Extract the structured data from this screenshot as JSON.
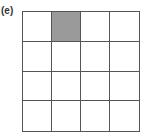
{
  "figure": {
    "label": "(e)",
    "grid": {
      "rows": 4,
      "cols": 4,
      "shaded_cells": [
        {
          "row": 0,
          "col": 1
        }
      ],
      "line_color": "#555555",
      "shade_color": "#9a9a9a"
    }
  }
}
